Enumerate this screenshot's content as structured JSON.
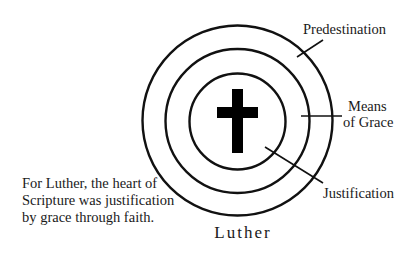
{
  "diagram": {
    "title": "Luther",
    "center_icon": "cross-icon",
    "rings": [
      {
        "name": "inner",
        "label": "Justification"
      },
      {
        "name": "middle",
        "label": "Means of Grace"
      },
      {
        "name": "outer",
        "label": "Predestination"
      }
    ],
    "labels": {
      "predestination": "Predestination",
      "means_line1": "Means",
      "means_line2": "of Grace",
      "justification": "Justification"
    },
    "caption": {
      "line1": "For Luther, the heart of",
      "line2": "Scripture was justification",
      "line3": "by grace through faith."
    },
    "colors": {
      "stroke": "#111111",
      "text": "#1a1a1a",
      "background": "#ffffff"
    }
  }
}
